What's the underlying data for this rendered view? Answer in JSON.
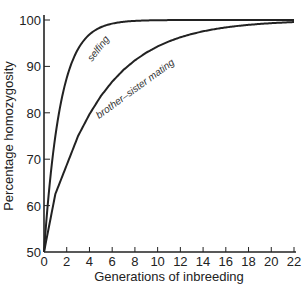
{
  "chart_data": {
    "type": "line",
    "title": "",
    "xlabel": "Generations of inbreeding",
    "ylabel": "Percentage homozygosity",
    "xlim": [
      0,
      22
    ],
    "ylim": [
      50,
      100
    ],
    "x_ticks": [
      0,
      2,
      4,
      6,
      8,
      10,
      12,
      14,
      16,
      18,
      20,
      22
    ],
    "y_ticks": [
      50,
      60,
      70,
      80,
      90,
      100
    ],
    "grid": false,
    "legend": "inline curve labels",
    "series": [
      {
        "name": "selfing",
        "x": [
          0,
          1,
          2,
          3,
          4,
          5,
          6,
          7,
          8,
          10,
          12,
          16,
          22
        ],
        "values": [
          50,
          75,
          87.5,
          93.8,
          96.9,
          98.4,
          99.2,
          99.6,
          99.8,
          99.9,
          100,
          100,
          100
        ]
      },
      {
        "name": "brother–sister mating",
        "x": [
          0,
          1,
          2,
          3,
          4,
          5,
          6,
          8,
          10,
          12,
          14,
          16,
          18,
          20,
          22
        ],
        "values": [
          50,
          62.5,
          68.8,
          74.2,
          78.7,
          82.4,
          85.5,
          90.2,
          93.3,
          95.5,
          97.0,
          98.0,
          98.7,
          99.2,
          99.5
        ]
      }
    ]
  },
  "labels": {
    "selfing": "selfing",
    "brother_sister": "brother–sister mating",
    "xlabel": "Generations of inbreeding",
    "ylabel": "Percentage homozygosity"
  },
  "ticks": {
    "x": [
      "0",
      "2",
      "4",
      "6",
      "8",
      "10",
      "12",
      "14",
      "16",
      "18",
      "20",
      "22"
    ],
    "y": [
      "50",
      "60",
      "70",
      "80",
      "90",
      "100"
    ]
  }
}
